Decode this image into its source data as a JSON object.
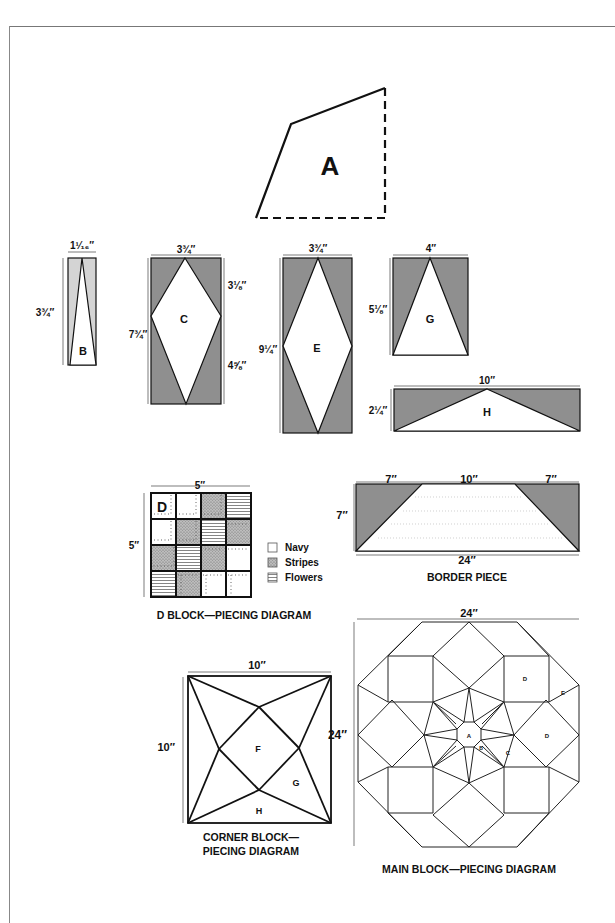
{
  "pieces": {
    "A": {
      "label": "A"
    },
    "B": {
      "label": "B",
      "width": "1¹⁄₁₆″",
      "height": "3¾″"
    },
    "C": {
      "label": "C",
      "width": "3¾″",
      "height": "7¾″",
      "upper": "3⅛″",
      "lower": "4⅝″"
    },
    "E": {
      "label": "E",
      "width": "3¾″",
      "height": "9¼″"
    },
    "G": {
      "label": "G",
      "width": "4″",
      "height": "5⅛″"
    },
    "H": {
      "label": "H",
      "width": "10″",
      "height": "2¼″"
    }
  },
  "d_block": {
    "label": "D",
    "size": "5″",
    "caption": "D BLOCK—PIECING DIAGRAM",
    "legend": [
      {
        "key": "navy",
        "label": "Navy"
      },
      {
        "key": "stripes",
        "label": "Stripes"
      },
      {
        "key": "flowers",
        "label": "Flowers"
      }
    ]
  },
  "border_piece": {
    "left": "7″",
    "top": "10″",
    "right": "7″",
    "height": "7″",
    "bottom": "24″",
    "caption": "BORDER PIECE"
  },
  "corner_block": {
    "width": "10″",
    "height": "10″",
    "labels": [
      "F",
      "G",
      "H"
    ],
    "caption_line1": "CORNER BLOCK—",
    "caption_line2": "PIECING DIAGRAM"
  },
  "main_block": {
    "width": "24″",
    "height": "24″",
    "labels": [
      "A",
      "B",
      "C",
      "D",
      "D",
      "E"
    ],
    "caption": "MAIN BLOCK—PIECING DIAGRAM"
  },
  "colors": {
    "shade": "#8f8f8f",
    "light_shade": "#d0d0d0",
    "stroke": "#1a1a1a"
  }
}
